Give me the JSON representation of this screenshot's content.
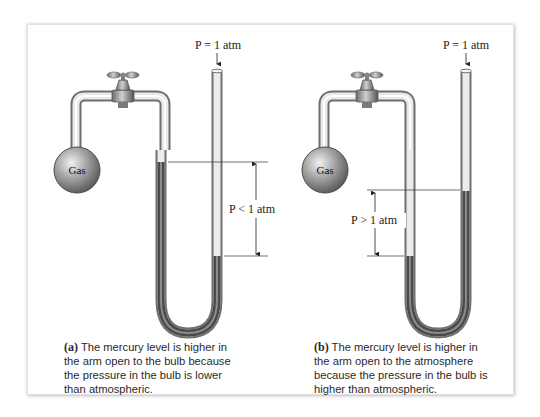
{
  "figure": {
    "panels": [
      {
        "id": "a",
        "atm_label": "P = 1 atm",
        "bulb_label": "Gas",
        "pressure_label": "P < 1 atm",
        "caption_tag": "(a)",
        "caption_text": " The mercury level is higher in the arm open to the bulb because the pressure in the bulb is lower than atmospheric."
      },
      {
        "id": "b",
        "atm_label": "P = 1 atm",
        "bulb_label": "Gas",
        "pressure_label": "P > 1 atm",
        "caption_tag": "(b)",
        "caption_text": " The mercury level is higher in the arm open to the atmosphere because the pressure in the bulb is higher than atmospheric."
      }
    ],
    "colors": {
      "mercury": "#5a5a5a",
      "glass": "#c8c8c8",
      "bulb": "#9a9a9a",
      "guide_line": "#333333"
    }
  }
}
